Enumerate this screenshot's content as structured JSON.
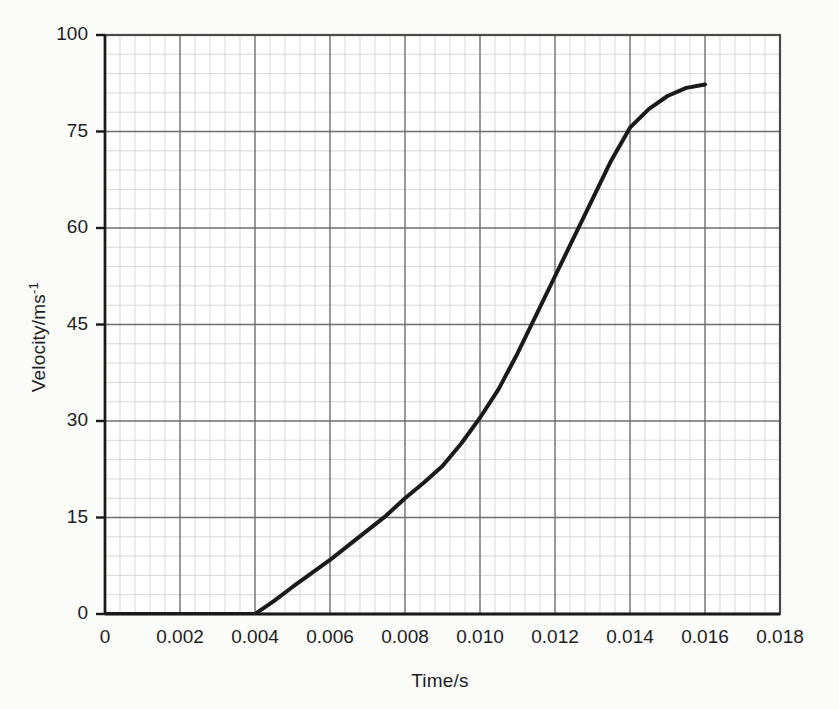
{
  "chart_data": {
    "type": "line",
    "title": "",
    "xlabel": "Time/s",
    "ylabel": "Velocity/ms-1",
    "ylabel_base": "Velocity/ms",
    "ylabel_exponent": "-1",
    "xlim": [
      0,
      0.018
    ],
    "ylim": [
      0,
      100
    ],
    "grid": true,
    "minor_grid": true,
    "minor_divisions_per_major": 5,
    "legend": "none",
    "xticks": [
      0,
      0.002,
      0.004,
      0.006,
      0.008,
      0.01,
      0.012,
      0.014,
      0.016,
      0.018
    ],
    "xtick_labels": [
      "0",
      "0.002",
      "0.004",
      "0.006",
      "0.008",
      "0.010",
      "0.012",
      "0.014",
      "0.016",
      "0.018"
    ],
    "yticks": [
      0,
      15,
      30,
      45,
      60,
      75,
      100
    ],
    "ytick_labels": [
      "0",
      "15",
      "30",
      "45",
      "60",
      "75",
      "100"
    ],
    "line_color": "#1a1a1a",
    "line_width": 4,
    "series": [
      {
        "name": "velocity",
        "x": [
          0.0,
          0.0005,
          0.001,
          0.0015,
          0.002,
          0.0025,
          0.003,
          0.0035,
          0.004,
          0.0045,
          0.005,
          0.0055,
          0.006,
          0.0065,
          0.007,
          0.0075,
          0.008,
          0.0085,
          0.009,
          0.0095,
          0.01,
          0.0105,
          0.011,
          0.0115,
          0.012,
          0.0125,
          0.013,
          0.0135,
          0.014,
          0.0145,
          0.015,
          0.0155,
          0.016
        ],
        "y": [
          0.0,
          0.0,
          0.0,
          0.0,
          0.0,
          0.0,
          0.0,
          0.0,
          0.0,
          2.0,
          4.2,
          6.3,
          8.4,
          10.7,
          13.0,
          15.3,
          18.0,
          20.4,
          23.0,
          26.5,
          30.5,
          35.0,
          40.5,
          46.5,
          52.5,
          58.5,
          64.5,
          70.5,
          76.0,
          80.8,
          84.2,
          86.3,
          87.2
        ]
      }
    ],
    "annotations": {
      "takeoff_time": 0.004,
      "plateau_value": 87,
      "end_time": 0.016
    }
  },
  "plot_geometry": {
    "left": 105,
    "right": 780,
    "top": 35,
    "bottom": 614
  }
}
